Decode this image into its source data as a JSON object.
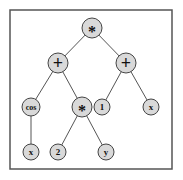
{
  "diagram": {
    "type": "expression-tree",
    "expression": "(cos(x) + 2*y) * (1 + x)",
    "frame": {
      "x": 10,
      "y": 10,
      "width": 162,
      "height": 159
    },
    "node_fill": "#d9d9d9",
    "nodes": [
      {
        "id": "n0",
        "label": "*",
        "kind": "operator",
        "x": 92,
        "y": 28,
        "r": 10,
        "font": 16
      },
      {
        "id": "n1",
        "label": "+",
        "kind": "operator",
        "x": 58,
        "y": 63,
        "r": 10,
        "font": 18
      },
      {
        "id": "n2",
        "label": "+",
        "kind": "operator",
        "x": 126,
        "y": 63,
        "r": 10,
        "font": 18
      },
      {
        "id": "n3",
        "label": "cos",
        "kind": "function",
        "x": 31,
        "y": 107,
        "r": 9,
        "font": 8
      },
      {
        "id": "n4",
        "label": "*",
        "kind": "operator",
        "x": 82,
        "y": 107,
        "r": 10,
        "font": 16
      },
      {
        "id": "n5",
        "label": "1",
        "kind": "constant",
        "x": 102,
        "y": 107,
        "r": 8,
        "font": 9
      },
      {
        "id": "n6",
        "label": "x",
        "kind": "variable",
        "x": 151,
        "y": 107,
        "r": 8,
        "font": 9
      },
      {
        "id": "n7",
        "label": "x",
        "kind": "variable",
        "x": 31,
        "y": 152,
        "r": 8,
        "font": 9
      },
      {
        "id": "n8",
        "label": "2",
        "kind": "constant",
        "x": 58,
        "y": 152,
        "r": 8,
        "font": 9
      },
      {
        "id": "n9",
        "label": "y",
        "kind": "variable",
        "x": 106,
        "y": 152,
        "r": 8,
        "font": 9
      }
    ],
    "edges": [
      [
        "n0",
        "n1"
      ],
      [
        "n0",
        "n2"
      ],
      [
        "n1",
        "n3"
      ],
      [
        "n1",
        "n4"
      ],
      [
        "n2",
        "n5"
      ],
      [
        "n2",
        "n6"
      ],
      [
        "n3",
        "n7"
      ],
      [
        "n4",
        "n8"
      ],
      [
        "n4",
        "n9"
      ]
    ]
  }
}
